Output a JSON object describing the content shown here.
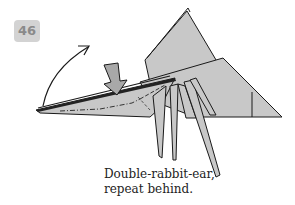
{
  "step": {
    "number": "46"
  },
  "caption": {
    "line1": "Double-rabbit-ear,",
    "line2": "repeat behind."
  },
  "colors": {
    "paper": "#c8c8c8",
    "paper_dark": "#b4b4b4",
    "outline": "#1a1a1a",
    "badge_bg": "#d3d3d3",
    "badge_text": "#8a8a8a"
  },
  "diagram": {
    "symbols": [
      "rotate-arrow",
      "push-arrow",
      "valley-fold-line",
      "mountain-fold-line"
    ]
  }
}
